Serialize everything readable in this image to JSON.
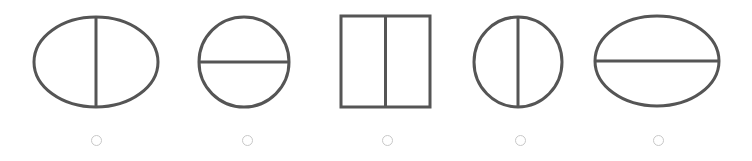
{
  "stroke_color": "#555555",
  "radio_color": "#c8c8c8",
  "options": [
    {
      "id": "option-1",
      "shape": "ellipse",
      "divider": "vertical",
      "cx": 96,
      "cy": 62,
      "rx": 62,
      "ry": 45,
      "radio_x": 96,
      "selected": false
    },
    {
      "id": "option-2",
      "shape": "circle",
      "divider": "horizontal",
      "cx": 244,
      "cy": 62,
      "rx": 45,
      "ry": 45,
      "radio_x": 247,
      "selected": false
    },
    {
      "id": "option-3",
      "shape": "rectangle",
      "divider": "vertical",
      "x": 341,
      "y": 16,
      "w": 89,
      "h": 91,
      "radio_x": 387,
      "selected": false
    },
    {
      "id": "option-4",
      "shape": "circle",
      "divider": "vertical",
      "cx": 518,
      "cy": 62,
      "rx": 44,
      "ry": 45,
      "radio_x": 520,
      "selected": false
    },
    {
      "id": "option-5",
      "shape": "ellipse",
      "divider": "horizontal",
      "cx": 657,
      "cy": 61,
      "rx": 62,
      "ry": 45,
      "radio_x": 658,
      "selected": false
    }
  ],
  "radio_y": 140
}
